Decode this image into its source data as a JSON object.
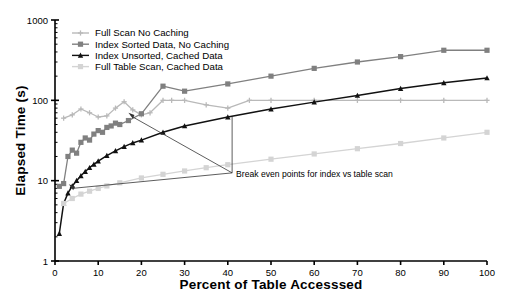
{
  "chart_data": {
    "type": "line",
    "title": "",
    "xlabel": "Percent of Table Accesssed",
    "ylabel": "Elapsed Time (s)",
    "xlim": [
      0,
      100
    ],
    "ylim": [
      1,
      1000
    ],
    "yscale": "log",
    "xticks": [
      0,
      10,
      20,
      30,
      40,
      50,
      60,
      70,
      80,
      90,
      100
    ],
    "xticklabels": [
      "0",
      "10",
      "20",
      "30",
      "40",
      "50",
      "60",
      "70",
      "80",
      "90",
      "100"
    ],
    "yticks": [
      1,
      10,
      100,
      1000
    ],
    "yticklabels": [
      "1",
      "10",
      "100",
      "1000"
    ],
    "grid": false,
    "legend_position": "top-left-inside",
    "series": [
      {
        "name": "Full Scan No Caching",
        "color": "#b9b9b9",
        "marker": "plus",
        "x": [
          2,
          4,
          6,
          8,
          10,
          12,
          14,
          16,
          18,
          20,
          22,
          25,
          27,
          30,
          35,
          40,
          45,
          50,
          60,
          70,
          80,
          90,
          100
        ],
        "y": [
          60,
          66,
          78,
          70,
          62,
          64,
          80,
          96,
          76,
          66,
          70,
          100,
          100,
          100,
          88,
          80,
          100,
          100,
          100,
          100,
          100,
          100,
          100
        ]
      },
      {
        "name": "Index Sorted Data, No Caching",
        "color": "#808080",
        "marker": "square",
        "x": [
          1,
          2,
          3,
          4,
          5,
          6,
          7,
          8,
          9,
          10,
          11,
          12,
          13,
          14,
          15,
          17,
          20,
          25,
          30,
          40,
          50,
          60,
          70,
          80,
          90,
          100
        ],
        "y": [
          8.5,
          9.2,
          20,
          24,
          22,
          30,
          34,
          32,
          38,
          42,
          40,
          46,
          48,
          52,
          50,
          56,
          68,
          150,
          130,
          160,
          200,
          250,
          300,
          350,
          420,
          420
        ]
      },
      {
        "name": "Index Unsorted, Cached Data",
        "color": "#111111",
        "marker": "triangle",
        "x": [
          1,
          2,
          3,
          4,
          5,
          6,
          7,
          8,
          9,
          10,
          12,
          14,
          16,
          18,
          20,
          25,
          30,
          40,
          50,
          60,
          70,
          80,
          90,
          100
        ],
        "y": [
          2.2,
          5.2,
          7.0,
          8.6,
          10.0,
          11.5,
          13.0,
          14.5,
          16.0,
          17.5,
          20.5,
          23.5,
          26.5,
          29.5,
          32,
          40,
          48,
          62,
          78,
          95,
          115,
          140,
          165,
          190
        ]
      },
      {
        "name": "Full Table Scan, Cached Data",
        "color": "#d4d4d4",
        "marker": "square",
        "x": [
          2,
          4,
          6,
          8,
          10,
          12,
          15,
          20,
          25,
          30,
          35,
          40,
          50,
          60,
          70,
          80,
          90,
          100
        ],
        "y": [
          5.2,
          6.0,
          6.8,
          7.4,
          8.0,
          8.6,
          9.4,
          10.8,
          12.0,
          13.2,
          14.5,
          15.8,
          18.5,
          21.5,
          25,
          29,
          34,
          40
        ]
      }
    ],
    "annotations": [
      {
        "text": "Break even points for index vs table scan",
        "x_pct": 41,
        "y_value": 12.5
      }
    ],
    "breakeven_points": [
      {
        "x_pct": 17,
        "y_value": 70
      },
      {
        "x_pct": 3.2,
        "y_value": 9.0
      }
    ]
  }
}
